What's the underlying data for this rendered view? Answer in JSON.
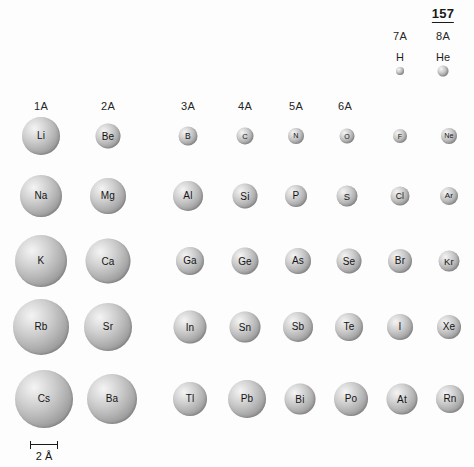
{
  "figure": {
    "page_number": "157",
    "background_color": "#fdfdfd",
    "sphere_color": "#b4b4b4"
  },
  "group_headers": [
    {
      "label": "1A",
      "x": 41,
      "y": 100
    },
    {
      "label": "2A",
      "x": 108,
      "y": 100
    },
    {
      "label": "3A",
      "x": 188,
      "y": 100
    },
    {
      "label": "4A",
      "x": 245,
      "y": 100
    },
    {
      "label": "5A",
      "x": 296,
      "y": 100
    },
    {
      "label": "6A",
      "x": 345,
      "y": 100
    },
    {
      "label": "7A",
      "x": 400,
      "y": 30
    },
    {
      "label": "8A",
      "x": 443,
      "y": 30
    }
  ],
  "page_number_marker": {
    "text": "157",
    "x": 443,
    "y": 6
  },
  "period1": [
    {
      "symbol": "H",
      "x": 400,
      "y": 71,
      "d": 8,
      "label_y": 51
    },
    {
      "symbol": "He",
      "x": 443,
      "y": 71,
      "d": 11,
      "label_y": 51
    }
  ],
  "rows": [
    {
      "name": "period-2",
      "y": 136,
      "atoms": [
        {
          "symbol": "Li",
          "x": 41,
          "d": 38
        },
        {
          "symbol": "Be",
          "x": 108,
          "d": 25
        },
        {
          "symbol": "B",
          "x": 188,
          "d": 19
        },
        {
          "symbol": "C",
          "x": 245,
          "d": 17
        },
        {
          "symbol": "N",
          "x": 296,
          "d": 16
        },
        {
          "symbol": "O",
          "x": 347,
          "d": 15
        },
        {
          "symbol": "F",
          "x": 400,
          "d": 14
        },
        {
          "symbol": "Ne",
          "x": 449,
          "d": 16
        }
      ]
    },
    {
      "name": "period-3",
      "y": 196,
      "atoms": [
        {
          "symbol": "Na",
          "x": 41,
          "d": 42
        },
        {
          "symbol": "Mg",
          "x": 108,
          "d": 36
        },
        {
          "symbol": "Al",
          "x": 188,
          "d": 30
        },
        {
          "symbol": "Si",
          "x": 245,
          "d": 25
        },
        {
          "symbol": "P",
          "x": 296,
          "d": 22
        },
        {
          "symbol": "S",
          "x": 347,
          "d": 21
        },
        {
          "symbol": "Cl",
          "x": 400,
          "d": 19
        },
        {
          "symbol": "Ar",
          "x": 449,
          "d": 18
        }
      ]
    },
    {
      "name": "period-4",
      "y": 261,
      "atoms": [
        {
          "symbol": "K",
          "x": 41,
          "d": 52
        },
        {
          "symbol": "Ca",
          "x": 108,
          "d": 45
        },
        {
          "symbol": "Ga",
          "x": 190,
          "d": 28
        },
        {
          "symbol": "Ge",
          "x": 245,
          "d": 27
        },
        {
          "symbol": "As",
          "x": 298,
          "d": 26
        },
        {
          "symbol": "Se",
          "x": 349,
          "d": 25
        },
        {
          "symbol": "Br",
          "x": 400,
          "d": 24
        },
        {
          "symbol": "Kr",
          "x": 449,
          "d": 21
        }
      ]
    },
    {
      "name": "period-5",
      "y": 327,
      "atoms": [
        {
          "symbol": "Rb",
          "x": 41,
          "d": 56
        },
        {
          "symbol": "Sr",
          "x": 108,
          "d": 48
        },
        {
          "symbol": "In",
          "x": 190,
          "d": 33
        },
        {
          "symbol": "Sn",
          "x": 245,
          "d": 31
        },
        {
          "symbol": "Sb",
          "x": 298,
          "d": 30
        },
        {
          "symbol": "Te",
          "x": 349,
          "d": 28
        },
        {
          "symbol": "I",
          "x": 400,
          "d": 26
        },
        {
          "symbol": "Xe",
          "x": 449,
          "d": 24
        }
      ]
    },
    {
      "name": "period-6",
      "y": 399,
      "atoms": [
        {
          "symbol": "Cs",
          "x": 44,
          "d": 58
        },
        {
          "symbol": "Ba",
          "x": 112,
          "d": 50
        },
        {
          "symbol": "Tl",
          "x": 190,
          "d": 34
        },
        {
          "symbol": "Pb",
          "x": 247,
          "d": 38
        },
        {
          "symbol": "Bi",
          "x": 300,
          "d": 31
        },
        {
          "symbol": "Po",
          "x": 351,
          "d": 34
        },
        {
          "symbol": "At",
          "x": 402,
          "d": 31
        },
        {
          "symbol": "Rn",
          "x": 450,
          "d": 28
        }
      ]
    }
  ],
  "scale": {
    "caption": "2 Å",
    "x": 30,
    "y": 444,
    "width": 28
  },
  "chart_data": {
    "type": "scatter",
    "note": "Sphere diameter is proportional to atomic radius; scale bar = 2 Å",
    "xlabel": "Group",
    "ylabel": "Period",
    "categories": [
      "1A",
      "2A",
      "3A",
      "4A",
      "5A",
      "6A",
      "7A",
      "8A"
    ],
    "series": [
      {
        "name": "Period 1",
        "elements": [
          "H",
          "He"
        ],
        "diameters_px": [
          8,
          11
        ]
      },
      {
        "name": "Period 2",
        "elements": [
          "Li",
          "Be",
          "B",
          "C",
          "N",
          "O",
          "F",
          "Ne"
        ],
        "diameters_px": [
          38,
          25,
          19,
          17,
          16,
          15,
          14,
          16
        ]
      },
      {
        "name": "Period 3",
        "elements": [
          "Na",
          "Mg",
          "Al",
          "Si",
          "P",
          "S",
          "Cl",
          "Ar"
        ],
        "diameters_px": [
          42,
          36,
          30,
          25,
          22,
          21,
          19,
          18
        ]
      },
      {
        "name": "Period 4",
        "elements": [
          "K",
          "Ca",
          "Ga",
          "Ge",
          "As",
          "Se",
          "Br",
          "Kr"
        ],
        "diameters_px": [
          52,
          45,
          28,
          27,
          26,
          25,
          24,
          21
        ]
      },
      {
        "name": "Period 5",
        "elements": [
          "Rb",
          "Sr",
          "In",
          "Sn",
          "Sb",
          "Te",
          "I",
          "Xe"
        ],
        "diameters_px": [
          56,
          48,
          33,
          31,
          30,
          28,
          26,
          24
        ]
      },
      {
        "name": "Period 6",
        "elements": [
          "Cs",
          "Ba",
          "Tl",
          "Pb",
          "Bi",
          "Po",
          "At",
          "Rn"
        ],
        "diameters_px": [
          58,
          50,
          34,
          38,
          31,
          34,
          31,
          28
        ]
      }
    ],
    "scale_reference": {
      "label": "2 Å",
      "length_px": 28
    },
    "legend": "none",
    "grid": false
  }
}
